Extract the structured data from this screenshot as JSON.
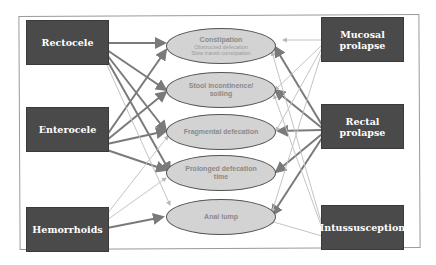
{
  "diagram": {
    "left_nodes": [
      {
        "id": "rectocele",
        "label": "Rectocele"
      },
      {
        "id": "enterocele",
        "label": "Enterocele"
      },
      {
        "id": "hemorrhoids",
        "label": "Hemorrhoids"
      }
    ],
    "right_nodes": [
      {
        "id": "mucosal_prolapse",
        "label": "Mucosal prolapse"
      },
      {
        "id": "rectal_prolapse",
        "label": "Rectal prolapse"
      },
      {
        "id": "intussusception",
        "label": "Intussusception"
      }
    ],
    "symptoms": [
      {
        "id": "constipation",
        "label": "Constipation",
        "sub1": "Obstructed defecation",
        "sub2": "Slow transit constipation"
      },
      {
        "id": "stool_incontinence",
        "label": "Stool incontinence/",
        "label2": "soiling"
      },
      {
        "id": "fragmental",
        "label": "Fragmental defecation"
      },
      {
        "id": "prolonged",
        "label": "Prolonged defecation",
        "label2": "time"
      },
      {
        "id": "anal_lump",
        "label": "Anal lump"
      }
    ],
    "colors": {
      "box_fill": "#4a4a4a",
      "ellipse_fill": "#d3d3d3",
      "strong_arrow": "#7a7a7a",
      "weak_arrow": "#c4c4c4"
    }
  }
}
